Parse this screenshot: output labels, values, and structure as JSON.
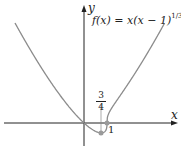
{
  "axes": {
    "x_label": "x",
    "y_label": "y"
  },
  "function_label": "f(x) = x(x − 1)",
  "function_exponent": "1/3",
  "annotations": {
    "min_x_numerator": "3",
    "min_x_denominator": "4",
    "root_label": "1"
  },
  "colors": {
    "curve": "#8c8c8c",
    "axis": "#222222",
    "point": "#9a9a9a"
  },
  "chart_data": {
    "type": "line",
    "xlabel": "x",
    "ylabel": "y",
    "xlim": [
      -3.6,
      4.1
    ],
    "ylim": [
      -1.2,
      5.8
    ],
    "grid": false,
    "series": [
      {
        "name": "f(x) = x(x-1)^(1/3)",
        "x": [
          -3,
          -2,
          -1,
          0,
          0.5,
          0.75,
          1,
          1.5,
          2,
          3,
          3.5
        ],
        "y": [
          4.76,
          2.88,
          1.26,
          0,
          -0.4,
          -0.47,
          0,
          1.19,
          2,
          3.78,
          4.75
        ]
      }
    ],
    "points": [
      {
        "x": 0.75,
        "y": -0.47,
        "label": "3/4 (minimum)"
      },
      {
        "x": 1,
        "y": 0,
        "label": "1"
      }
    ]
  }
}
